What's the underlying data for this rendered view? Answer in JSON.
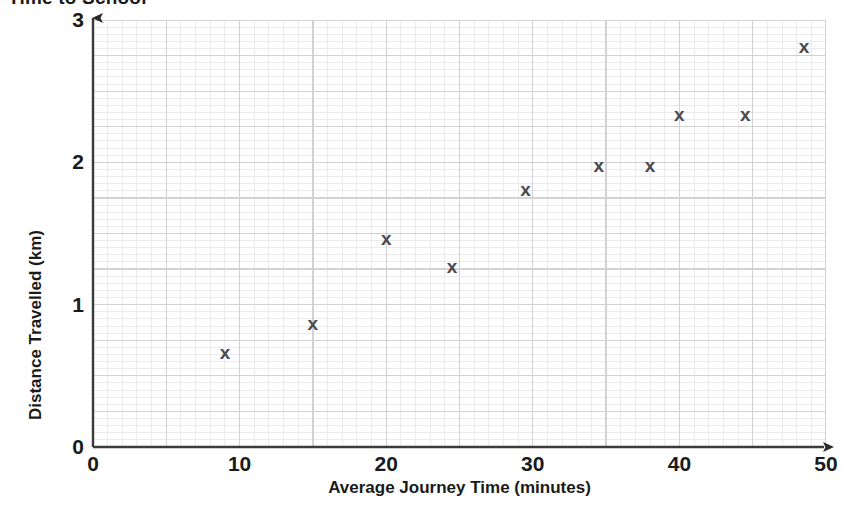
{
  "chart_data": {
    "type": "scatter",
    "title": "Time to School",
    "xlabel": "Average Journey Time (minutes)",
    "ylabel": "Distance Travelled (km)",
    "xlim": [
      0,
      50
    ],
    "ylim": [
      0,
      3
    ],
    "xticks": [
      "0",
      "10",
      "20",
      "30",
      "40",
      "50"
    ],
    "xtick_values": [
      0,
      10,
      20,
      30,
      40,
      50
    ],
    "yticks": [
      "0",
      "1",
      "2",
      "3"
    ],
    "ytick_values": [
      0,
      1,
      2,
      3
    ],
    "grid": true,
    "grid_minor_step_x": 1,
    "grid_minor_step_y": 0.05,
    "grid_major_step_x": 5,
    "grid_major_step_y": 0.25,
    "legend": null,
    "marker": "x",
    "marker_color": "#4a4a4f",
    "grid_minor_color": "#ebebee",
    "grid_major_color": "#d2d2d6",
    "axis_color": "#3a3a3a",
    "points": [
      {
        "x": 9,
        "y": 0.67,
        "label": "x"
      },
      {
        "x": 15,
        "y": 0.87,
        "label": "x"
      },
      {
        "x": 20,
        "y": 1.47,
        "label": "x"
      },
      {
        "x": 24.5,
        "y": 1.27,
        "label": "x"
      },
      {
        "x": 29.5,
        "y": 1.81,
        "label": "x"
      },
      {
        "x": 34.5,
        "y": 1.98,
        "label": "x"
      },
      {
        "x": 38,
        "y": 1.98,
        "label": "x"
      },
      {
        "x": 40,
        "y": 2.34,
        "label": "x"
      },
      {
        "x": 44.5,
        "y": 2.34,
        "label": "x"
      },
      {
        "x": 48.5,
        "y": 2.82,
        "label": "x"
      }
    ]
  }
}
